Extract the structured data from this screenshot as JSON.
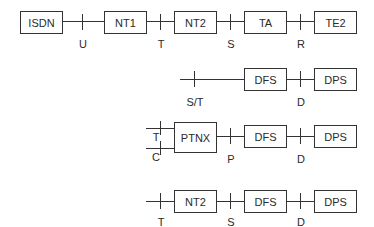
{
  "rows": [
    {
      "boxes": [
        {
          "label": "ISDN"
        },
        {
          "label": "NT1"
        },
        {
          "label": "NT2"
        },
        {
          "label": "TA"
        },
        {
          "label": "TE2"
        }
      ],
      "refs": [
        "U",
        "T",
        "S",
        "R"
      ]
    },
    {
      "boxes": [
        {
          "label": "DFS"
        },
        {
          "label": "DPS"
        }
      ],
      "refs": [
        "S/T",
        "D"
      ]
    },
    {
      "boxes": [
        {
          "label": "PTNX"
        },
        {
          "label": "DFS"
        },
        {
          "label": "DPS"
        }
      ],
      "refs": [
        "T",
        "C",
        "P",
        "D"
      ]
    },
    {
      "boxes": [
        {
          "label": "NT2"
        },
        {
          "label": "DFS"
        },
        {
          "label": "DPS"
        }
      ],
      "refs": [
        "T",
        "S",
        "D"
      ]
    }
  ]
}
